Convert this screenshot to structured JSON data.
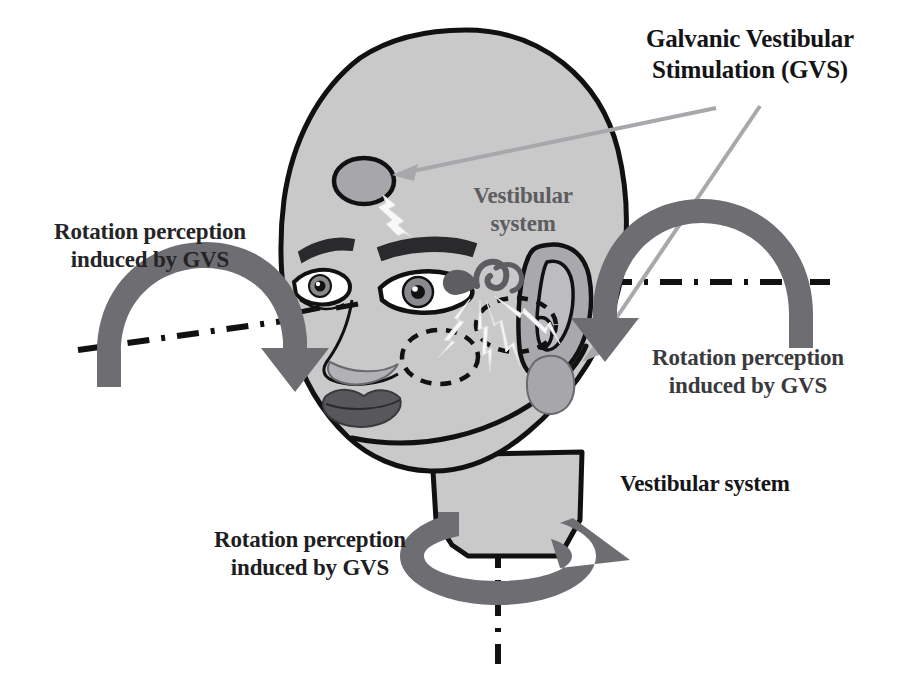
{
  "figure": {
    "canvas": {
      "width": 900,
      "height": 686
    }
  },
  "labels": {
    "gvs_title": "Galvanic Vestibular\nStimulation (GVS)",
    "rotation_left": "Rotation perception\ninduced by GVS",
    "rotation_right": "Rotation perception\ninduced by GVS",
    "rotation_bottom": "Rotation perception\ninduced by GVS",
    "vestibular_system_callout": "Vestibular system",
    "vestibular_system_head": "Vestibular\nsystem"
  },
  "colors": {
    "skin_fill": "#c9c9c9",
    "outline": "#111111",
    "arrow_gray": "#6e6e72",
    "pointer_gray": "#a8a8ac",
    "electrode_fill": "#a7a7ab",
    "lips": "#58585c",
    "iris": "#8a8a8e",
    "background": "#ffffff",
    "text_dark": "#18181a",
    "text_gray": "#5d5d61",
    "spark_white": "#f8f8f8"
  },
  "icons": {
    "forehead_electrode": "electrode-ellipse-icon",
    "mastoid_electrode": "electrode-blob-icon",
    "vestibular_organ": "cochlea-icon",
    "hidden_vestibular_left": "dashed-ellipse-icon",
    "hidden_vestibular_right": "dashed-ellipse-icon",
    "current_spark_forehead": "lightning-bolt-icon",
    "current_spark_mastoid": "lightning-bolt-icon",
    "pointer_to_forehead": "pointer-arrow-icon",
    "pointer_to_mastoid": "pointer-arrow-icon",
    "rotation_arrow_left": "curved-rotation-arrow-icon",
    "rotation_arrow_right": "curved-rotation-arrow-icon",
    "rotation_arrow_bottom": "spiral-rotation-arrow-icon",
    "axis_roll": "dash-dot-axis-icon",
    "axis_yaw": "dash-dot-axis-icon",
    "head": "head-profile-icon",
    "ear": "ear-icon",
    "eye_left": "eye-icon",
    "eye_right": "eye-icon",
    "nose": "nose-icon",
    "mouth": "lips-icon"
  }
}
